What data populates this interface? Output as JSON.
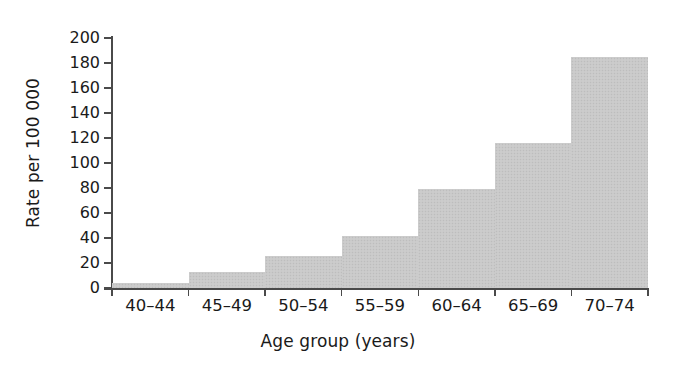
{
  "chart_data": {
    "type": "bar",
    "title": "",
    "subtitle": "",
    "xlabel": "Age group (years)",
    "ylabel": "Rate per 100 000",
    "categories": [
      "40–44",
      "45–49",
      "50–54",
      "55–59",
      "60–64",
      "65–69",
      "70–74"
    ],
    "values": [
      4,
      13,
      26,
      42,
      79,
      116,
      185
    ],
    "ylim": [
      0,
      200
    ],
    "ytick_labels": [
      "200",
      "180",
      "160",
      "140",
      "120",
      "100",
      "80",
      "60",
      "40",
      "20",
      "0"
    ],
    "ytick_values": [
      200,
      180,
      160,
      140,
      120,
      100,
      80,
      60,
      40,
      20,
      0
    ],
    "grid": false,
    "legend": false,
    "legend_position": "none",
    "bar_color": "#c9c9c9",
    "axis_color": "#4a4a4a",
    "text_color": "#1a1a1a",
    "bars_contiguous": true,
    "annotations": []
  }
}
